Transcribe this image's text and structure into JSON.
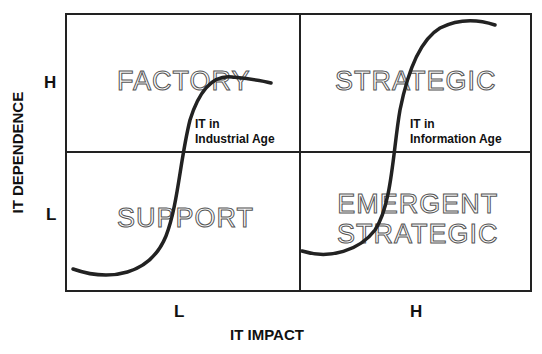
{
  "axes": {
    "y_label": "IT DEPENDENCE",
    "y_ticks": [
      "H",
      "L"
    ],
    "x_label": "IT IMPACT",
    "x_ticks": [
      "L",
      "H"
    ]
  },
  "quadrants": {
    "top_left": "FACTORY",
    "top_right": "STRATEGIC",
    "bottom_left": "SUPPORT",
    "bottom_right_line1": "EMERGENT",
    "bottom_right_line2": "STRATEGIC"
  },
  "curves": {
    "industrial": {
      "line1": "IT in",
      "line2": "Industrial Age"
    },
    "information": {
      "line1": "IT in",
      "line2": "Information Age"
    }
  }
}
